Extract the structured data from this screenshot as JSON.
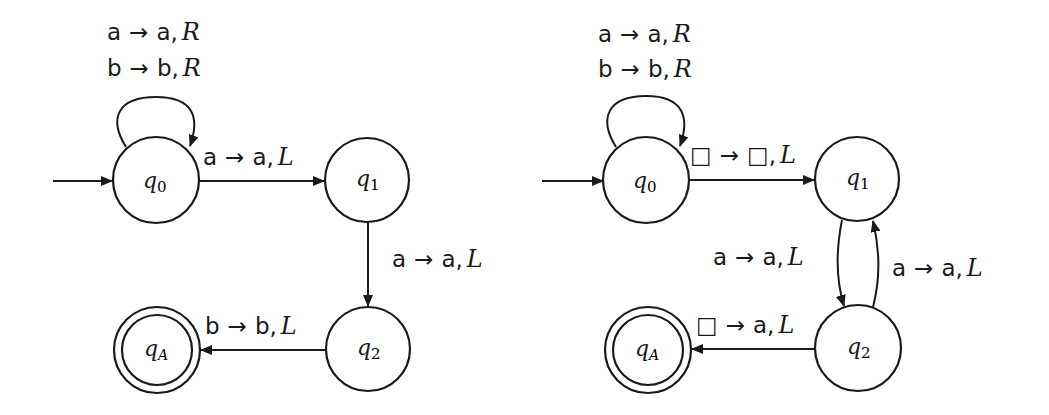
{
  "diagrams": [
    {
      "id": "left",
      "states": {
        "q0": {
          "base": "q",
          "sub": "0"
        },
        "q1": {
          "base": "q",
          "sub": "1"
        },
        "q2": {
          "base": "q",
          "sub": "2"
        },
        "qA": {
          "base": "q",
          "sub": "A"
        }
      },
      "transitions": {
        "q0_loop": {
          "line1_read": "a",
          "line1_arrow": "→",
          "line1_write": "a,",
          "line1_move": "R",
          "line2_read": "b",
          "line2_arrow": "→",
          "line2_write": "b,",
          "line2_move": "R"
        },
        "q0_q1": {
          "read": "a",
          "arrow": "→",
          "write": "a,",
          "move": "L"
        },
        "q1_q2": {
          "read": "a",
          "arrow": "→",
          "write": "a,",
          "move": "L"
        },
        "q2_qA": {
          "read": "b",
          "arrow": "→",
          "write": "b,",
          "move": "L"
        }
      }
    },
    {
      "id": "right",
      "states": {
        "q0": {
          "base": "q",
          "sub": "0"
        },
        "q1": {
          "base": "q",
          "sub": "1"
        },
        "q2": {
          "base": "q",
          "sub": "2"
        },
        "qA": {
          "base": "q",
          "sub": "A"
        }
      },
      "transitions": {
        "q0_loop": {
          "line1_read": "a",
          "line1_arrow": "→",
          "line1_write": "a,",
          "line1_move": "R",
          "line2_read": "b",
          "line2_arrow": "→",
          "line2_write": "b,",
          "line2_move": "R"
        },
        "q0_q1": {
          "read": "□",
          "arrow": "→",
          "write": "□,",
          "move": "L"
        },
        "q1_q2": {
          "read": "a",
          "arrow": "→",
          "write": "a,",
          "move": "L"
        },
        "q2_q1": {
          "read": "a",
          "arrow": "→",
          "write": "a,",
          "move": "L"
        },
        "q2_qA": {
          "read": "□",
          "arrow": "→",
          "write": "a,",
          "move": "L"
        }
      }
    }
  ]
}
